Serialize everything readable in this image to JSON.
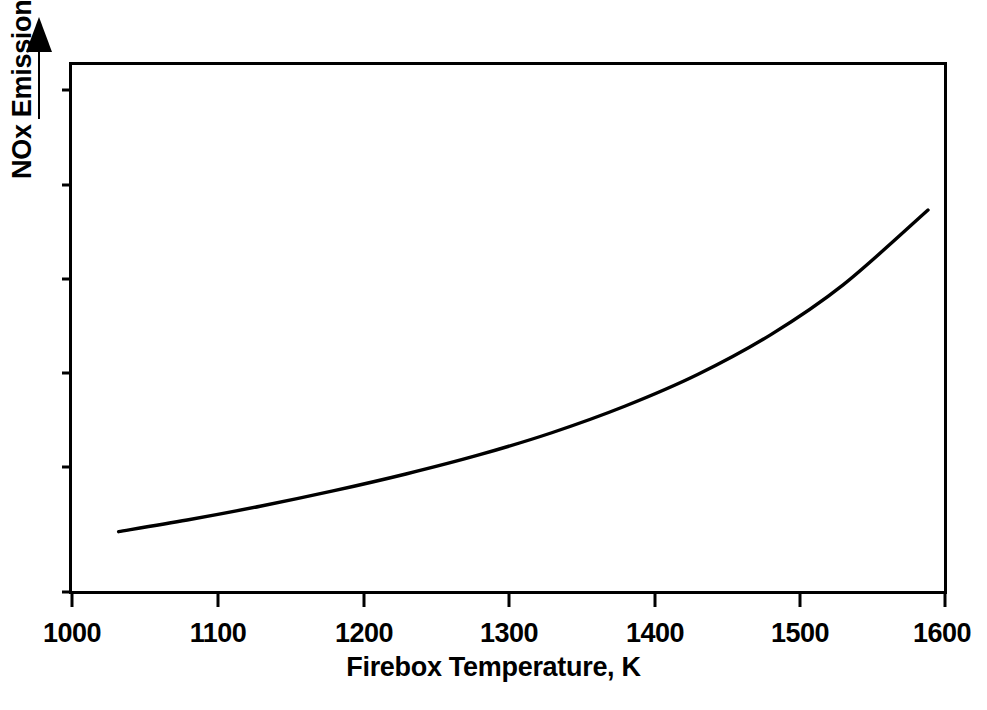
{
  "figure": {
    "background_color": "#ffffff",
    "line_color": "#000000",
    "axis_color": "#000000"
  },
  "axes": {
    "x_title": "Firebox Temperature, K",
    "y_title": "NOx Emissions, Increasing",
    "y_arrow_icon": "up-arrow-icon",
    "x_tick_labels": [
      "1000",
      "1100",
      "1200",
      "1300",
      "1400",
      "1500",
      "1600"
    ]
  },
  "chart_data": {
    "type": "line",
    "title": "",
    "subtitle": "",
    "xlabel": "Firebox Temperature, K",
    "ylabel": "NOx Emissions, Increasing",
    "xlim": [
      1000,
      1600
    ],
    "ylim": [
      0,
      100
    ],
    "grid": false,
    "legend": null,
    "xticks": [
      1000,
      1100,
      1200,
      1300,
      1400,
      1500,
      1600
    ],
    "xticklabels": [
      "1000",
      "1100",
      "1200",
      "1300",
      "1400",
      "1500",
      "1600"
    ],
    "yticks": [],
    "yticklabels": [],
    "y_axis_qualitative": true,
    "annotations": [
      {
        "text": "NOx Emissions, Increasing",
        "type": "axis-label-with-arrow",
        "direction": "up"
      }
    ],
    "series": [
      {
        "name": "NOx emissions vs firebox temperature",
        "x": [
          1033,
          1080,
          1130,
          1180,
          1230,
          1280,
          1330,
          1380,
          1430,
          1480,
          1530,
          1588
        ],
        "y": [
          11.5,
          13.7,
          16.3,
          19.2,
          22.4,
          26.0,
          30.2,
          35.2,
          41.2,
          48.7,
          58.2,
          72.3
        ]
      }
    ]
  }
}
